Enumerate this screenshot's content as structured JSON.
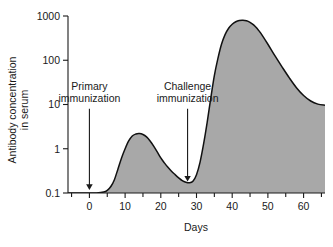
{
  "chart_data": {
    "type": "area",
    "title": "",
    "xlabel": "Days",
    "ylabel": "Antibody concentration in serum",
    "ylabel_line1": "Antibody concentration",
    "ylabel_line2": "in serum",
    "yscale": "log",
    "ylim": [
      0.1,
      1000
    ],
    "xlim": [
      -6,
      66
    ],
    "grid": false,
    "legend": null,
    "fill_color": "#a8a8a8",
    "line_color": "#111111",
    "axis_color": "#1a1a1a",
    "background": "#ffffff",
    "y_ticks": [
      0.1,
      1,
      10,
      100,
      1000
    ],
    "y_tick_labels": [
      "0.1",
      "1",
      "10",
      "100",
      "1000"
    ],
    "x_ticks": [
      0,
      10,
      20,
      30,
      40,
      50,
      60
    ],
    "x_tick_labels": [
      "0",
      "10",
      "20",
      "30",
      "40",
      "50",
      "60"
    ],
    "x_minor_ticks": [
      -5,
      5,
      15,
      25,
      35,
      45,
      55,
      65
    ],
    "series": [
      {
        "name": "Antibody concentration",
        "x": [
          -6,
          -2,
          0,
          2,
          4,
          5,
          6,
          7,
          8,
          9,
          10,
          11,
          12,
          13,
          14,
          15,
          16,
          17,
          18,
          19,
          20,
          21,
          22,
          23,
          24,
          25,
          26,
          27,
          28,
          29,
          30,
          31,
          32,
          33,
          34,
          35,
          36,
          37,
          38,
          39,
          40,
          41,
          42,
          43,
          44,
          45,
          46,
          47,
          48,
          50,
          52,
          54,
          56,
          58,
          60,
          62,
          64,
          66
        ],
        "y": [
          0.1,
          0.1,
          0.1,
          0.1,
          0.105,
          0.115,
          0.14,
          0.2,
          0.35,
          0.62,
          1.0,
          1.5,
          1.95,
          2.15,
          2.2,
          2.1,
          1.85,
          1.5,
          1.15,
          0.85,
          0.62,
          0.48,
          0.38,
          0.31,
          0.26,
          0.22,
          0.19,
          0.175,
          0.17,
          0.185,
          0.26,
          0.5,
          1.3,
          4.0,
          14.0,
          45.0,
          110.0,
          230.0,
          380.0,
          530.0,
          650.0,
          740.0,
          790.0,
          800.0,
          780.0,
          720.0,
          630.0,
          520.0,
          410.0,
          230.0,
          125.0,
          70.0,
          40.0,
          24.0,
          16.0,
          12.0,
          10.2,
          9.6
        ]
      }
    ],
    "annotations": [
      {
        "id": "primary-immunization",
        "label_line1": "Primary",
        "label_line2": "immunization",
        "x_day": 0,
        "arrow_from_y": 8.0,
        "arrow_to_y": 0.135
      },
      {
        "id": "challenge-immunization",
        "label_line1": "Challenge",
        "label_line2": "immunization",
        "x_day": 27.5,
        "arrow_from_y": 8.0,
        "arrow_to_y": 0.21
      }
    ]
  }
}
